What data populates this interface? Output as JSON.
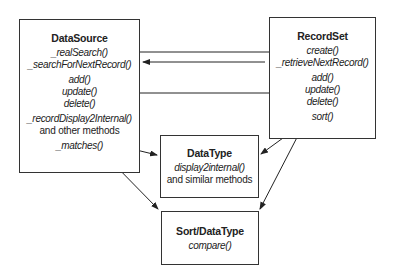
{
  "boxes": {
    "datasource": {
      "title": "DataSource",
      "methods": [
        "_realSearch()",
        "_searchForNextRecord()",
        "add()",
        "update()",
        "delete()",
        "_recordDisplay2Internal()"
      ],
      "note": "and other methods",
      "matches": "_matches()"
    },
    "recordset": {
      "title": "RecordSet",
      "methods": [
        "create()",
        "_retrieveNextRecord()",
        "add()",
        "update()",
        "delete()",
        "sort()"
      ]
    },
    "datatype": {
      "title": "DataType",
      "methods": [
        "display2internal()"
      ],
      "note": "and similar methods"
    },
    "sortdatatype": {
      "title": "Sort/DataType",
      "methods": [
        "compare()"
      ]
    }
  },
  "connections": [
    {
      "from": "DataSource._realSearch()",
      "to": "RecordSet.create()"
    },
    {
      "from": "RecordSet._retrieveNextRecord()",
      "to": "DataSource._searchForNextRecord()"
    },
    {
      "from": "RecordSet.update()",
      "to": "DataSource.update()"
    },
    {
      "from": "DataSource._recordDisplay2Internal()",
      "to": "DataType"
    },
    {
      "from": "DataSource._matches()",
      "to": "Sort/DataType"
    },
    {
      "from": "RecordSet.sort()",
      "to": "DataType"
    },
    {
      "from": "RecordSet.sort()",
      "to": "Sort/DataType"
    }
  ]
}
